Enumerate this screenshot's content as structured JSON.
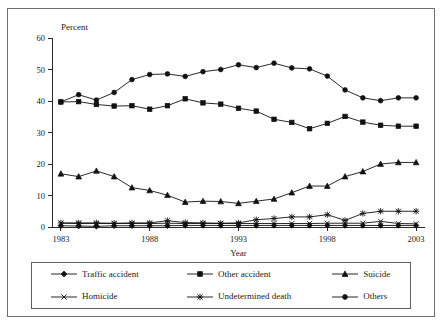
{
  "figure": {
    "border_color": "#6f6f6f",
    "background": "#ffffff",
    "ink_color": "#111111"
  },
  "chart_data": {
    "type": "line",
    "title": "",
    "subtitle": "",
    "xlabel": "Year",
    "ylabel": "Percent",
    "ylabel_position": "above-axis",
    "grid": false,
    "legend_position": "bottom",
    "legend_columns": 3,
    "xlim": [
      1982.5,
      2003.5
    ],
    "ylim": [
      0,
      60
    ],
    "yticks": [
      0,
      10,
      20,
      30,
      40,
      50,
      60
    ],
    "ytick_labels": [
      "0",
      "10",
      "20",
      "30",
      "40",
      "50",
      "60"
    ],
    "xticks": [
      1983,
      1988,
      1993,
      1998,
      2003
    ],
    "xtick_labels": [
      "1983",
      "1988",
      "1993",
      "1998",
      "2003"
    ],
    "x": [
      1983,
      1984,
      1985,
      1986,
      1987,
      1988,
      1989,
      1990,
      1991,
      1992,
      1993,
      1994,
      1995,
      1996,
      1997,
      1998,
      1999,
      2000,
      2001,
      2002,
      2003
    ],
    "series": [
      {
        "name": "Others",
        "marker": "circle",
        "marker_filled": true,
        "values": [
          39.7,
          42.0,
          40.3,
          42.7,
          46.8,
          48.4,
          48.6,
          47.8,
          49.3,
          50.0,
          51.5,
          50.6,
          52.0,
          50.5,
          50.2,
          47.9,
          43.5,
          41.0,
          40.1,
          41.0,
          41.0
        ]
      },
      {
        "name": "Other accident",
        "marker": "square",
        "marker_filled": true,
        "values": [
          39.7,
          39.8,
          38.9,
          38.4,
          38.5,
          37.4,
          38.5,
          40.7,
          39.4,
          39.0,
          37.7,
          36.8,
          34.2,
          33.2,
          31.2,
          32.9,
          35.1,
          33.3,
          32.3,
          32.0,
          32.0
        ]
      },
      {
        "name": "Suicide",
        "marker": "triangle",
        "marker_filled": true,
        "values": [
          16.9,
          16.0,
          17.8,
          16.0,
          12.5,
          11.6,
          10.1,
          7.9,
          8.2,
          8.1,
          7.5,
          8.2,
          8.9,
          10.9,
          13.0,
          13.0,
          16.0,
          17.6,
          20.0,
          20.5,
          20.5
        ]
      },
      {
        "name": "Undetermined death",
        "marker": "asterisk",
        "marker_filled": false,
        "values": [
          1.3,
          1.3,
          1.3,
          1.2,
          1.3,
          1.3,
          2.0,
          1.4,
          1.3,
          1.2,
          1.3,
          2.3,
          2.7,
          3.2,
          3.2,
          3.9,
          2.1,
          4.3,
          5.0,
          5.0,
          5.0
        ]
      },
      {
        "name": "Homicide",
        "marker": "cross",
        "marker_filled": false,
        "values": [
          1.2,
          1.1,
          1.1,
          1.1,
          1.1,
          1.1,
          1.2,
          1.1,
          1.1,
          1.1,
          1.1,
          1.1,
          1.1,
          1.1,
          1.1,
          1.2,
          1.2,
          1.2,
          1.8,
          1.1,
          1.0
        ]
      },
      {
        "name": "Traffic accident",
        "marker": "diamond",
        "marker_filled": true,
        "values": [
          0.4,
          0.3,
          0.2,
          0.4,
          0.4,
          0.4,
          0.4,
          0.5,
          0.5,
          0.5,
          0.5,
          0.5,
          0.5,
          0.5,
          0.5,
          0.5,
          0.5,
          0.5,
          0.5,
          0.5,
          0.5
        ]
      }
    ]
  },
  "legend": {
    "items": [
      {
        "label": "Traffic accident",
        "marker": "diamond",
        "series": "Traffic accident"
      },
      {
        "label": "Other accident",
        "marker": "square",
        "series": "Other accident"
      },
      {
        "label": "Suicide",
        "marker": "triangle",
        "series": "Suicide"
      },
      {
        "label": "Homicide",
        "marker": "cross",
        "series": "Homicide"
      },
      {
        "label": "Undetermined death",
        "marker": "asterisk",
        "series": "Undetermined death"
      },
      {
        "label": "Others",
        "marker": "circle",
        "series": "Others"
      }
    ]
  }
}
